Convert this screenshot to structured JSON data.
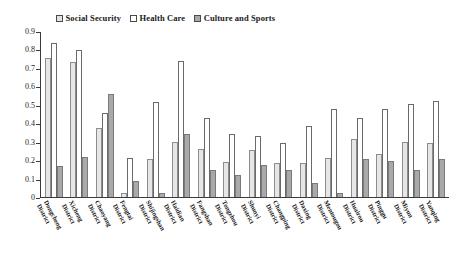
{
  "chart_data": {
    "type": "bar",
    "title": "",
    "xlabel": "",
    "ylabel": "",
    "ylim": [
      0,
      0.9
    ],
    "grid": false,
    "legend_position": "top",
    "y_ticks": [
      "0",
      "0.1",
      "0.2",
      "0.3",
      "0.4",
      "0.5",
      "0.6",
      "0.7",
      "0.8",
      "0.9"
    ],
    "y_tick_values": [
      0,
      0.1,
      0.2,
      0.3,
      0.4,
      0.5,
      0.6,
      0.7,
      0.8,
      0.9
    ],
    "categories": [
      "Dongcheng District",
      "Xicheng District",
      "Chaoyang District",
      "Fengtai District",
      "Shijingshan District",
      "Haidian District",
      "Fangshan District",
      "Tongzhou District",
      "Shunyi District",
      "Changping District",
      "Daxing District",
      "Mentougou District",
      "Huairou District",
      "Pinggu District",
      "Miyun District",
      "Yanqing District"
    ],
    "series": [
      {
        "name": "Social Security",
        "color": "#e6e6e6",
        "values": [
          0.76,
          0.735,
          0.375,
          0.02,
          0.21,
          0.3,
          0.26,
          0.19,
          0.255,
          0.185,
          0.185,
          0.215,
          0.315,
          0.235,
          0.3,
          0.295
        ]
      },
      {
        "name": "Health Care",
        "color": "#ffffff",
        "values": [
          0.84,
          0.8,
          0.46,
          0.215,
          0.52,
          0.74,
          0.43,
          0.345,
          0.335,
          0.295,
          0.39,
          0.48,
          0.43,
          0.48,
          0.51,
          0.525
        ]
      },
      {
        "name": "Culture and Sports",
        "color": "#a9a9a9",
        "values": [
          0.17,
          0.22,
          0.56,
          0.085,
          0.02,
          0.345,
          0.145,
          0.12,
          0.175,
          0.145,
          0.075,
          0.02,
          0.205,
          0.195,
          0.145,
          0.205
        ]
      }
    ]
  }
}
